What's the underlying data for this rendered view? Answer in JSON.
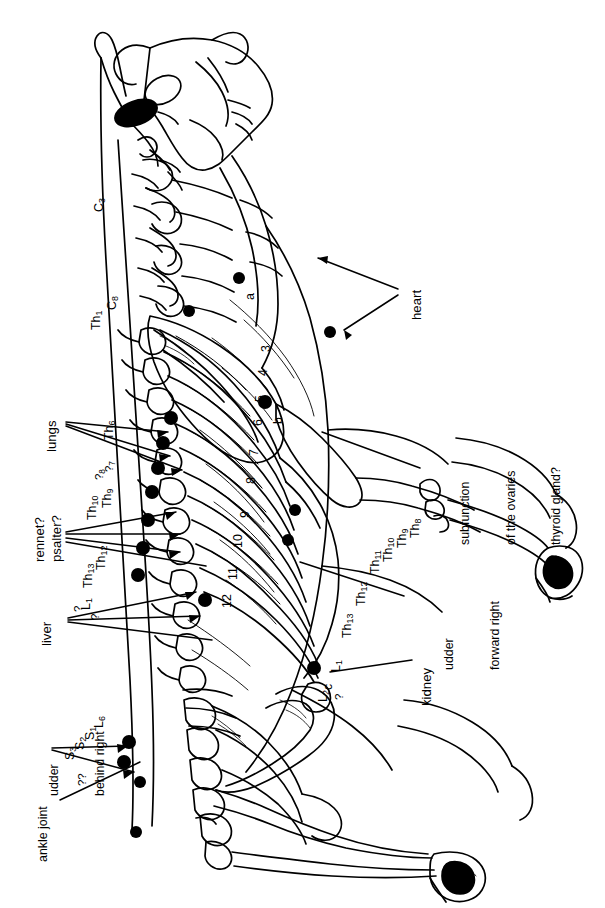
{
  "figure": {
    "type": "anatomical-diagram",
    "orientation": "rotated 90 degrees counter-clockwise (landscape drawing on portrait page)",
    "line_color": "#000000",
    "background_color": "#ffffff"
  },
  "organ_labels": [
    {
      "id": "heart",
      "text": "heart",
      "x": 410,
      "y": 280
    },
    {
      "id": "lungs",
      "text": "lungs",
      "x": 45,
      "y": 408
    },
    {
      "id": "rennet",
      "text": "rennet?",
      "x": 33,
      "y": 502
    },
    {
      "id": "psalter",
      "text": "psalter?",
      "x": 50,
      "y": 502
    },
    {
      "id": "liver",
      "text": "liver",
      "x": 40,
      "y": 600
    },
    {
      "id": "kidney",
      "text": "kidney",
      "x": 420,
      "y": 650
    }
  ],
  "multiline_labels": [
    {
      "id": "subfunction-ovaries-thyroid",
      "lines": [
        "subfunction",
        "of the ovaries",
        "thyroid gland?"
      ],
      "x": 428,
      "y": 455
    },
    {
      "id": "udder-forward-right",
      "lines": [
        "udder",
        "forward right"
      ],
      "x": 412,
      "y": 582
    },
    {
      "id": "udder-behind-right",
      "lines": [
        "udder",
        "behind right"
      ],
      "x": 17,
      "y": 712
    },
    {
      "id": "ankle-joint",
      "lines": [
        "ankle joint"
      ],
      "x": 37,
      "y": 790
    }
  ],
  "vertebra_labels": [
    {
      "id": "c3",
      "main": "C",
      "sub": "3",
      "x": 93,
      "y": 185
    },
    {
      "id": "c8",
      "main": "C",
      "sub": "8",
      "x": 106,
      "y": 284
    },
    {
      "id": "th1",
      "main": "Th",
      "sub": "1",
      "x": 90,
      "y": 298
    },
    {
      "id": "th6",
      "main": "Th",
      "sub": "6",
      "x": 103,
      "y": 414
    },
    {
      "id": "th7q",
      "main": "?",
      "sub": "7",
      "x": 103,
      "y": 448
    },
    {
      "id": "th8q",
      "main": "?",
      "sub": "8",
      "x": 94,
      "y": 455
    },
    {
      "id": "th9",
      "main": "Th",
      "sub": "9",
      "x": 101,
      "y": 480
    },
    {
      "id": "th10",
      "main": "Th",
      "sub": "10",
      "x": 87,
      "y": 487
    },
    {
      "id": "th12",
      "main": "Th",
      "sub": "12",
      "x": 95,
      "y": 538
    },
    {
      "id": "th13",
      "main": "Th",
      "sub": "13",
      "x": 83,
      "y": 554
    },
    {
      "id": "l1",
      "main": "L",
      "sub": "1",
      "x": 81,
      "y": 584
    },
    {
      "id": "q1",
      "main": "?",
      "sub": "",
      "x": 73,
      "y": 597
    },
    {
      "id": "q2",
      "main": "?",
      "sub": "",
      "x": 90,
      "y": 607
    },
    {
      "id": "l6",
      "main": "L",
      "sub": "6",
      "x": 93,
      "y": 702
    },
    {
      "id": "s1",
      "main": "S",
      "sub": "1",
      "x": 85,
      "y": 713
    },
    {
      "id": "s2",
      "main": "S",
      "sub": "2",
      "x": 75,
      "y": 722
    },
    {
      "id": "s3",
      "main": "S",
      "sub": "3",
      "x": 65,
      "y": 730
    },
    {
      "id": "qq",
      "main": "??",
      "sub": "",
      "x": 76,
      "y": 760
    }
  ],
  "vertebra_labels_right": [
    {
      "id": "th8r",
      "main": "Th",
      "sub": "8",
      "x": 409,
      "y": 510
    },
    {
      "id": "th9r",
      "main": "Th",
      "sub": "9",
      "x": 397,
      "y": 518
    },
    {
      "id": "th10r",
      "main": "Th",
      "sub": "10",
      "x": 383,
      "y": 528
    },
    {
      "id": "th11r",
      "main": "Th",
      "sub": "11",
      "x": 370,
      "y": 540
    },
    {
      "id": "th12r",
      "main": "Th",
      "sub": "12",
      "x": 356,
      "y": 572
    },
    {
      "id": "th13r",
      "main": "Th",
      "sub": "13",
      "x": 342,
      "y": 604
    },
    {
      "id": "l1r",
      "main": "L",
      "sub": "1",
      "x": 330,
      "y": 648
    },
    {
      "id": "l2r",
      "main": "L",
      "sub": "2",
      "x": 318,
      "y": 676
    },
    {
      "id": "qr",
      "main": "?",
      "sub": "",
      "x": 333,
      "y": 676
    }
  ],
  "rib_numbers": [
    {
      "id": "rib3",
      "text": "3",
      "x": 260,
      "y": 338
    },
    {
      "id": "rib4",
      "text": "4",
      "x": 257,
      "y": 362
    },
    {
      "id": "rib5",
      "text": "5",
      "x": 255,
      "y": 388
    },
    {
      "id": "rib6",
      "text": "6",
      "x": 253,
      "y": 412
    },
    {
      "id": "rib7",
      "text": "7",
      "x": 249,
      "y": 442
    },
    {
      "id": "rib8",
      "text": "8",
      "x": 246,
      "y": 470
    },
    {
      "id": "rib9",
      "text": "9",
      "x": 240,
      "y": 504
    },
    {
      "id": "rib10",
      "text": "10",
      "x": 233,
      "y": 528
    },
    {
      "id": "rib11",
      "text": "11",
      "x": 228,
      "y": 560
    },
    {
      "id": "rib12",
      "text": "12",
      "x": 222,
      "y": 588
    }
  ],
  "point_markers": [
    {
      "id": "marker-a",
      "text": "a",
      "x": 244,
      "y": 288
    },
    {
      "id": "marker-b",
      "text": "b",
      "x": 272,
      "y": 412
    },
    {
      "id": "marker-c",
      "text": "c",
      "x": 322,
      "y": 678
    }
  ]
}
